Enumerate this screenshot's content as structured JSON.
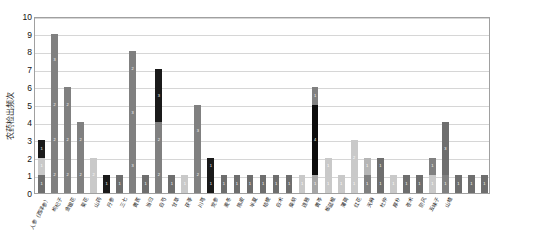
{
  "chart_data": {
    "type": "bar",
    "stacked": true,
    "title": "",
    "xlabel": "",
    "ylabel": "农药检出频次",
    "ylim": [
      0,
      10
    ],
    "yticks": [
      0,
      1,
      2,
      3,
      4,
      5,
      6,
      7,
      8,
      9,
      10
    ],
    "grid": true,
    "legend": "none",
    "series_colors": [
      "#808080",
      "#c9c9c9",
      "#1a1a1a",
      "#a6a6a6",
      "#6e6e6e"
    ],
    "categories": [
      "人参（西洋参）",
      "枸杞子",
      "金银花",
      "菊花",
      "山药",
      "丹参",
      "三七",
      "黄芪",
      "当归",
      "白芍",
      "甘草",
      "茯苓",
      "川芎",
      "党参",
      "麦冬",
      "陈皮",
      "半夏",
      "桔梗",
      "白术",
      "柴胡",
      "连翘",
      "黄芩",
      "板蓝根",
      "薄荷",
      "红花",
      "天麻",
      "杜仲",
      "厚朴",
      "苍术",
      "防风",
      "五味子",
      "山楂"
    ],
    "bars": [
      {
        "category": "人参（西洋参）",
        "total": 3,
        "segments": [
          {
            "value": 1,
            "color": "#6e6e6e",
            "label": "1"
          },
          {
            "value": 1,
            "color": "#c9c9c9",
            "label": "1"
          },
          {
            "value": 1,
            "color": "#1a1a1a",
            "label": "1"
          }
        ]
      },
      {
        "category": "枸杞子",
        "total": 9,
        "segments": [
          {
            "value": 2,
            "color": "#808080",
            "label": "2"
          },
          {
            "value": 2,
            "color": "#808080",
            "label": "2"
          },
          {
            "value": 2,
            "color": "#808080",
            "label": "2"
          },
          {
            "value": 3,
            "color": "#808080",
            "label": "3"
          }
        ]
      },
      {
        "category": "金银花",
        "total": 6,
        "segments": [
          {
            "value": 2,
            "color": "#808080",
            "label": "2"
          },
          {
            "value": 2,
            "color": "#808080",
            "label": "2"
          },
          {
            "value": 2,
            "color": "#808080",
            "label": "2"
          }
        ]
      },
      {
        "category": "菊花",
        "total": 4,
        "segments": [
          {
            "value": 2,
            "color": "#808080",
            "label": "2"
          },
          {
            "value": 2,
            "color": "#808080",
            "label": "2"
          }
        ]
      },
      {
        "category": "山药",
        "total": 2,
        "segments": [
          {
            "value": 2,
            "color": "#c9c9c9",
            "label": "2"
          }
        ]
      },
      {
        "category": "丹参",
        "total": 1,
        "segments": [
          {
            "value": 1,
            "color": "#1a1a1a",
            "label": "1"
          }
        ]
      },
      {
        "category": "三七",
        "total": 1,
        "segments": [
          {
            "value": 1,
            "color": "#6e6e6e",
            "label": "1"
          }
        ]
      },
      {
        "category": "黄芪",
        "total": 8,
        "segments": [
          {
            "value": 3,
            "color": "#808080",
            "label": "3"
          },
          {
            "value": 3,
            "color": "#808080",
            "label": "3"
          },
          {
            "value": 2,
            "color": "#808080",
            "label": "2"
          }
        ]
      },
      {
        "category": "当归",
        "total": 1,
        "segments": [
          {
            "value": 1,
            "color": "#6e6e6e",
            "label": "1"
          }
        ]
      },
      {
        "category": "白芍",
        "total": 7,
        "segments": [
          {
            "value": 2,
            "color": "#808080",
            "label": "2"
          },
          {
            "value": 2,
            "color": "#808080",
            "label": "2"
          },
          {
            "value": 3,
            "color": "#1a1a1a",
            "label": "3"
          }
        ]
      },
      {
        "category": "甘草",
        "total": 1,
        "segments": [
          {
            "value": 1,
            "color": "#6e6e6e",
            "label": "1"
          }
        ]
      },
      {
        "category": "茯苓",
        "total": 1,
        "segments": [
          {
            "value": 1,
            "color": "#c9c9c9",
            "label": "1"
          }
        ]
      },
      {
        "category": "川芎",
        "total": 5,
        "segments": [
          {
            "value": 2,
            "color": "#808080",
            "label": "2"
          },
          {
            "value": 3,
            "color": "#808080",
            "label": "3"
          }
        ]
      },
      {
        "category": "党参",
        "total": 2,
        "segments": [
          {
            "value": 1,
            "color": "#1a1a1a",
            "label": "1"
          },
          {
            "value": 1,
            "color": "#1a1a1a",
            "label": "1"
          }
        ]
      },
      {
        "category": "麦冬",
        "total": 1,
        "segments": [
          {
            "value": 1,
            "color": "#6e6e6e",
            "label": "1"
          }
        ]
      },
      {
        "category": "陈皮",
        "total": 1,
        "segments": [
          {
            "value": 1,
            "color": "#6e6e6e",
            "label": "1"
          }
        ]
      },
      {
        "category": "半夏",
        "total": 1,
        "segments": [
          {
            "value": 1,
            "color": "#6e6e6e",
            "label": "1"
          }
        ]
      },
      {
        "category": "桔梗",
        "total": 1,
        "segments": [
          {
            "value": 1,
            "color": "#6e6e6e",
            "label": "1"
          }
        ]
      },
      {
        "category": "白术",
        "total": 1,
        "segments": [
          {
            "value": 1,
            "color": "#6e6e6e",
            "label": "1"
          }
        ]
      },
      {
        "category": "柴胡",
        "total": 1,
        "segments": [
          {
            "value": 1,
            "color": "#6e6e6e",
            "label": "1"
          }
        ]
      },
      {
        "category": "连翘",
        "total": 1,
        "segments": [
          {
            "value": 1,
            "color": "#c9c9c9",
            "label": "1"
          }
        ]
      },
      {
        "category": "黄芩",
        "total": 6,
        "segments": [
          {
            "value": 1,
            "color": "#a6a6a6",
            "label": "1"
          },
          {
            "value": 4,
            "color": "#0d0d0d",
            "label": "4"
          },
          {
            "value": 1,
            "color": "#808080",
            "label": "1"
          }
        ]
      },
      {
        "category": "板蓝根",
        "total": 2,
        "segments": [
          {
            "value": 1,
            "color": "#c9c9c9",
            "label": "1"
          },
          {
            "value": 1,
            "color": "#c9c9c9",
            "label": "1"
          }
        ]
      },
      {
        "category": "薄荷",
        "total": 1,
        "segments": [
          {
            "value": 1,
            "color": "#c9c9c9",
            "label": "1"
          }
        ]
      },
      {
        "category": "红花",
        "total": 3,
        "segments": [
          {
            "value": 1,
            "color": "#c9c9c9",
            "label": "1"
          },
          {
            "value": 2,
            "color": "#c9c9c9",
            "label": "2"
          }
        ]
      },
      {
        "category": "天麻",
        "total": 2,
        "segments": [
          {
            "value": 1,
            "color": "#808080",
            "label": "1"
          },
          {
            "value": 1,
            "color": "#b5b5b5",
            "label": "1"
          }
        ]
      },
      {
        "category": "杜仲",
        "total": 2,
        "segments": [
          {
            "value": 1,
            "color": "#6e6e6e",
            "label": "1"
          },
          {
            "value": 1,
            "color": "#6e6e6e",
            "label": "1"
          }
        ]
      },
      {
        "category": "厚朴",
        "total": 1,
        "segments": [
          {
            "value": 1,
            "color": "#c9c9c9",
            "label": "1"
          }
        ]
      },
      {
        "category": "苍术",
        "total": 1,
        "segments": [
          {
            "value": 1,
            "color": "#6e6e6e",
            "label": "1"
          }
        ]
      },
      {
        "category": "防风",
        "total": 1,
        "segments": [
          {
            "value": 1,
            "color": "#6e6e6e",
            "label": "1"
          }
        ]
      },
      {
        "category": "五味子",
        "total": 2,
        "segments": [
          {
            "value": 1,
            "color": "#c9c9c9",
            "label": "1"
          },
          {
            "value": 1,
            "color": "#808080",
            "label": "1"
          }
        ]
      },
      {
        "category": "山楂",
        "total": 4,
        "segments": [
          {
            "value": 1,
            "color": "#808080",
            "label": "1"
          },
          {
            "value": 3,
            "color": "#6e6e6e",
            "label": "3"
          }
        ]
      },
      {
        "category": "",
        "total": 1,
        "segments": [
          {
            "value": 1,
            "color": "#6e6e6e",
            "label": "1"
          }
        ]
      },
      {
        "category": "",
        "total": 1,
        "segments": [
          {
            "value": 1,
            "color": "#6e6e6e",
            "label": "1"
          }
        ]
      },
      {
        "category": "",
        "total": 1,
        "segments": [
          {
            "value": 1,
            "color": "#6e6e6e",
            "label": "1"
          }
        ]
      }
    ]
  }
}
